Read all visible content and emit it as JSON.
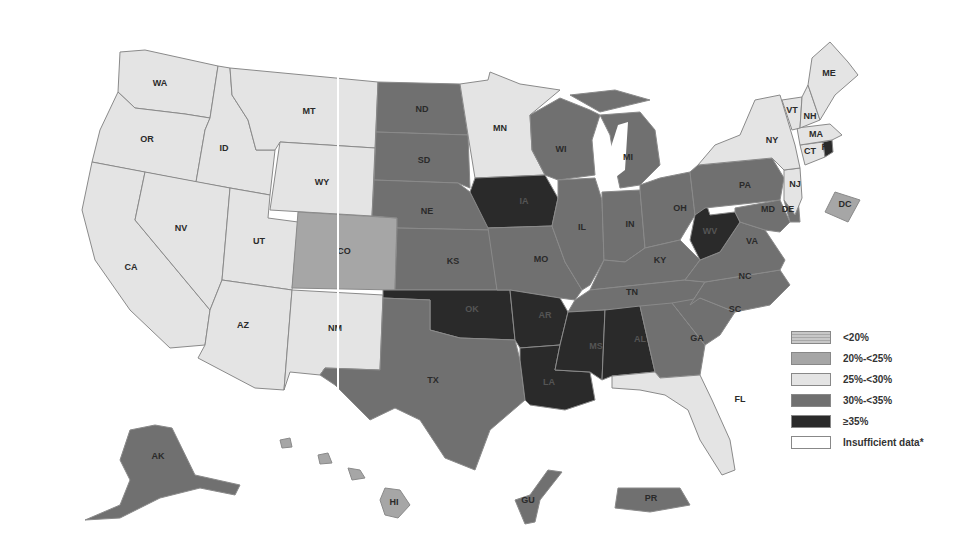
{
  "legend": {
    "items": [
      {
        "label": "<20%",
        "color": "#bdbdbd",
        "pattern": "dots"
      },
      {
        "label": "20%-<25%",
        "color": "#a6a6a6"
      },
      {
        "label": "25%-<30%",
        "color": "#e4e4e4"
      },
      {
        "label": "30%-<35%",
        "color": "#707070"
      },
      {
        "label": "≥35%",
        "color": "#2a2a2a"
      },
      {
        "label": "Insufficient data*",
        "color": "#ffffff"
      }
    ]
  },
  "categories": {
    "lt20": "#bdbdbd",
    "c20_25": "#a6a6a6",
    "c25_30": "#e4e4e4",
    "c30_35": "#707070",
    "ge35": "#2a2a2a",
    "insufficient": "#ffffff"
  },
  "states": [
    {
      "abbr": "WA",
      "category": "25%-<30%"
    },
    {
      "abbr": "OR",
      "category": "25%-<30%"
    },
    {
      "abbr": "CA",
      "category": "25%-<30%"
    },
    {
      "abbr": "ID",
      "category": "25%-<30%"
    },
    {
      "abbr": "NV",
      "category": "25%-<30%"
    },
    {
      "abbr": "UT",
      "category": "25%-<30%"
    },
    {
      "abbr": "AZ",
      "category": "25%-<30%"
    },
    {
      "abbr": "MT",
      "category": "25%-<30%"
    },
    {
      "abbr": "WY",
      "category": "25%-<30%"
    },
    {
      "abbr": "CO",
      "category": "20%-<25%"
    },
    {
      "abbr": "NM",
      "category": "25%-<30%"
    },
    {
      "abbr": "ND",
      "category": "30%-<35%"
    },
    {
      "abbr": "SD",
      "category": "30%-<35%"
    },
    {
      "abbr": "NE",
      "category": "30%-<35%"
    },
    {
      "abbr": "KS",
      "category": "30%-<35%"
    },
    {
      "abbr": "OK",
      "category": "≥35%"
    },
    {
      "abbr": "TX",
      "category": "30%-<35%"
    },
    {
      "abbr": "MN",
      "category": "25%-<30%"
    },
    {
      "abbr": "IA",
      "category": "≥35%"
    },
    {
      "abbr": "MO",
      "category": "30%-<35%"
    },
    {
      "abbr": "AR",
      "category": "≥35%"
    },
    {
      "abbr": "LA",
      "category": "≥35%"
    },
    {
      "abbr": "WI",
      "category": "30%-<35%"
    },
    {
      "abbr": "IL",
      "category": "30%-<35%"
    },
    {
      "abbr": "MI",
      "category": "30%-<35%"
    },
    {
      "abbr": "IN",
      "category": "30%-<35%"
    },
    {
      "abbr": "OH",
      "category": "30%-<35%"
    },
    {
      "abbr": "KY",
      "category": "30%-<35%"
    },
    {
      "abbr": "TN",
      "category": "30%-<35%"
    },
    {
      "abbr": "MS",
      "category": "≥35%"
    },
    {
      "abbr": "AL",
      "category": "≥35%"
    },
    {
      "abbr": "GA",
      "category": "30%-<35%"
    },
    {
      "abbr": "FL",
      "category": "25%-<30%"
    },
    {
      "abbr": "SC",
      "category": "30%-<35%"
    },
    {
      "abbr": "NC",
      "category": "30%-<35%"
    },
    {
      "abbr": "VA",
      "category": "30%-<35%"
    },
    {
      "abbr": "WV",
      "category": "≥35%"
    },
    {
      "abbr": "PA",
      "category": "30%-<35%"
    },
    {
      "abbr": "MD",
      "category": "30%-<35%"
    },
    {
      "abbr": "DE",
      "category": "30%-<35%"
    },
    {
      "abbr": "NJ",
      "category": "25%-<30%"
    },
    {
      "abbr": "NY",
      "category": "25%-<30%"
    },
    {
      "abbr": "CT",
      "category": "25%-<30%"
    },
    {
      "abbr": "RI",
      "category": "≥35%"
    },
    {
      "abbr": "MA",
      "category": "25%-<30%"
    },
    {
      "abbr": "VT",
      "category": "25%-<30%"
    },
    {
      "abbr": "NH",
      "category": "25%-<30%"
    },
    {
      "abbr": "ME",
      "category": "25%-<30%"
    },
    {
      "abbr": "DC",
      "category": "20%-<25%"
    },
    {
      "abbr": "AK",
      "category": "30%-<35%"
    },
    {
      "abbr": "HI",
      "category": "20%-<25%"
    },
    {
      "abbr": "GU",
      "category": "30%-<35%"
    },
    {
      "abbr": "PR",
      "category": "30%-<35%"
    }
  ],
  "labels": {
    "WA": "WA",
    "OR": "OR",
    "CA": "CA",
    "ID": "ID",
    "NV": "NV",
    "UT": "UT",
    "AZ": "AZ",
    "MT": "MT",
    "WY": "WY",
    "CO": "CO",
    "NM": "NM",
    "ND": "ND",
    "SD": "SD",
    "NE": "NE",
    "KS": "KS",
    "OK": "OK",
    "TX": "TX",
    "MN": "MN",
    "IA": "IA",
    "MO": "MO",
    "AR": "AR",
    "LA": "LA",
    "WI": "WI",
    "IL": "IL",
    "MI": "MI",
    "IN": "IN",
    "OH": "OH",
    "KY": "KY",
    "TN": "TN",
    "MS": "MS",
    "AL": "AL",
    "GA": "GA",
    "FL": "FL",
    "SC": "SC",
    "NC": "NC",
    "VA": "VA",
    "WV": "WV",
    "PA": "PA",
    "MD": "MD",
    "DE": "DE",
    "NJ": "NJ",
    "NY": "NY",
    "CT": "CT",
    "RI": "RI",
    "MA": "MA",
    "VT": "VT",
    "NH": "NH",
    "ME": "ME",
    "DC": "DC",
    "AK": "AK",
    "HI": "HI",
    "GU": "GU",
    "PR": "PR"
  }
}
